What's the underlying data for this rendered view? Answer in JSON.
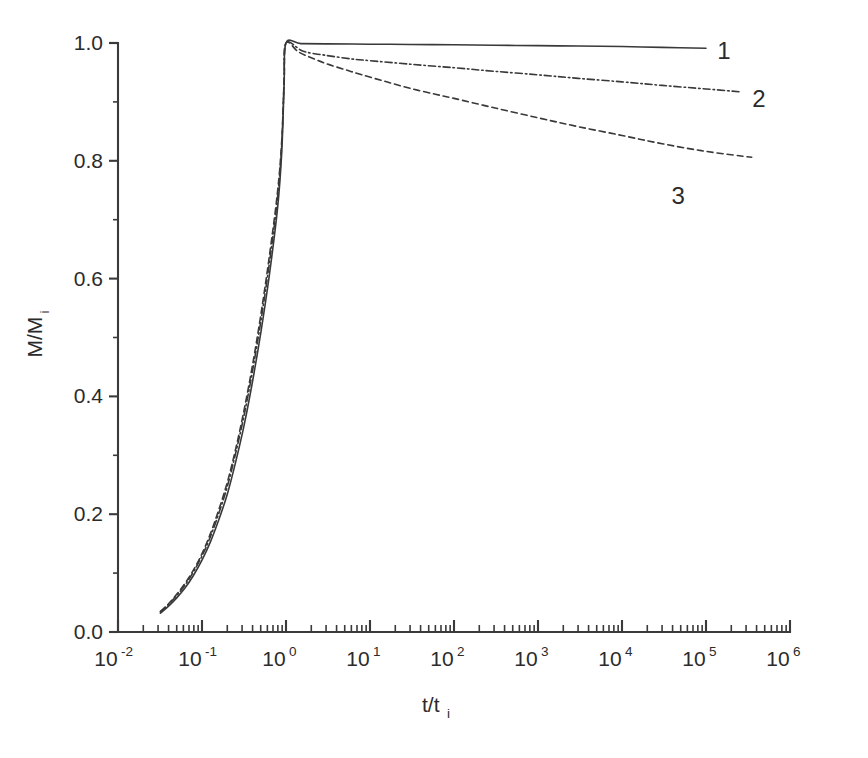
{
  "figure": {
    "background_color": "#ffffff",
    "line_color": "#39393b",
    "text_color": "#2b2b2b"
  },
  "chart_data": {
    "type": "line",
    "title": "",
    "subtitle": "",
    "xlabel": "t/t",
    "xlabel_sub": "i",
    "ylabel": "M/M",
    "ylabel_sub": "i",
    "xscale": "log",
    "yscale": "linear",
    "xlim": [
      0.01,
      1000000
    ],
    "ylim": [
      0.0,
      1.0
    ],
    "grid": false,
    "legend_position": "inline-right",
    "x_tick_labels": [
      "10-2",
      "10-1",
      "100",
      "101",
      "102",
      "103",
      "104",
      "105",
      "106"
    ],
    "x_tick_mantissa": [
      "10",
      "10",
      "10",
      "10",
      "10",
      "10",
      "10",
      "10",
      "10"
    ],
    "x_tick_exponents": [
      "-2",
      "-1",
      "0",
      "1",
      "2",
      "3",
      "4",
      "5",
      "6"
    ],
    "x_tick_values": [
      0.01,
      0.1,
      1,
      10,
      100,
      1000,
      10000,
      100000,
      1000000
    ],
    "y_tick_labels": [
      "0.0",
      "0.2",
      "0.4",
      "0.6",
      "0.8",
      "1.0"
    ],
    "y_tick_values": [
      0.0,
      0.2,
      0.4,
      0.6,
      0.8,
      1.0
    ],
    "y_minor_tick_values": [
      0.1,
      0.3,
      0.5,
      0.7,
      0.9
    ],
    "annotations": [
      {
        "name": "curve-label-1",
        "text": "1",
        "x": 100000,
        "y": 0.985
      },
      {
        "name": "curve-label-2",
        "text": "2",
        "x": 260000,
        "y": 0.925
      },
      {
        "name": "curve-label-3",
        "text": "3",
        "x": 90000,
        "y": 0.785
      }
    ],
    "series": [
      {
        "name": "1",
        "label": "1",
        "style": "solid",
        "points": [
          [
            0.032,
            0.032
          ],
          [
            0.04,
            0.044
          ],
          [
            0.05,
            0.058
          ],
          [
            0.063,
            0.075
          ],
          [
            0.079,
            0.096
          ],
          [
            0.1,
            0.122
          ],
          [
            0.126,
            0.153
          ],
          [
            0.158,
            0.19
          ],
          [
            0.2,
            0.234
          ],
          [
            0.251,
            0.288
          ],
          [
            0.316,
            0.35
          ],
          [
            0.398,
            0.424
          ],
          [
            0.501,
            0.508
          ],
          [
            0.631,
            0.604
          ],
          [
            0.794,
            0.72
          ],
          [
            0.89,
            0.815
          ],
          [
            0.95,
            0.93
          ],
          [
            1.0,
            1.0
          ],
          [
            1.5,
            0.999
          ],
          [
            3,
            0.9985
          ],
          [
            10,
            0.998
          ],
          [
            30,
            0.9975
          ],
          [
            100,
            0.997
          ],
          [
            300,
            0.9962
          ],
          [
            1000,
            0.9955
          ],
          [
            3000,
            0.9948
          ],
          [
            10000,
            0.994
          ],
          [
            30000,
            0.9925
          ],
          [
            100000,
            0.991
          ]
        ]
      },
      {
        "name": "2",
        "label": "2",
        "style": "dash-dot",
        "points": [
          [
            0.032,
            0.034
          ],
          [
            0.04,
            0.047
          ],
          [
            0.05,
            0.062
          ],
          [
            0.063,
            0.08
          ],
          [
            0.079,
            0.102
          ],
          [
            0.1,
            0.129
          ],
          [
            0.126,
            0.162
          ],
          [
            0.158,
            0.201
          ],
          [
            0.2,
            0.247
          ],
          [
            0.251,
            0.303
          ],
          [
            0.316,
            0.367
          ],
          [
            0.398,
            0.442
          ],
          [
            0.501,
            0.527
          ],
          [
            0.631,
            0.624
          ],
          [
            0.794,
            0.738
          ],
          [
            0.89,
            0.828
          ],
          [
            0.95,
            0.935
          ],
          [
            1.0,
            1.0
          ],
          [
            1.6,
            0.986
          ],
          [
            3,
            0.979
          ],
          [
            6,
            0.973
          ],
          [
            10,
            0.97
          ],
          [
            30,
            0.964
          ],
          [
            100,
            0.958
          ],
          [
            300,
            0.952
          ],
          [
            1000,
            0.946
          ],
          [
            3000,
            0.94
          ],
          [
            10000,
            0.934
          ],
          [
            30000,
            0.928
          ],
          [
            100000,
            0.922
          ],
          [
            260000,
            0.917
          ]
        ]
      },
      {
        "name": "3",
        "label": "3",
        "style": "dashed",
        "points": [
          [
            0.032,
            0.035
          ],
          [
            0.04,
            0.048
          ],
          [
            0.05,
            0.064
          ],
          [
            0.063,
            0.083
          ],
          [
            0.079,
            0.105
          ],
          [
            0.1,
            0.133
          ],
          [
            0.126,
            0.167
          ],
          [
            0.158,
            0.207
          ],
          [
            0.2,
            0.254
          ],
          [
            0.251,
            0.31
          ],
          [
            0.316,
            0.376
          ],
          [
            0.398,
            0.452
          ],
          [
            0.501,
            0.538
          ],
          [
            0.631,
            0.636
          ],
          [
            0.794,
            0.748
          ],
          [
            0.89,
            0.835
          ],
          [
            0.95,
            0.938
          ],
          [
            1.0,
            1.0
          ],
          [
            1.4,
            0.985
          ],
          [
            2,
            0.975
          ],
          [
            3,
            0.965
          ],
          [
            5,
            0.955
          ],
          [
            8,
            0.946
          ],
          [
            15,
            0.935
          ],
          [
            30,
            0.923
          ],
          [
            60,
            0.913
          ],
          [
            100,
            0.906
          ],
          [
            300,
            0.89
          ],
          [
            1000,
            0.873
          ],
          [
            3000,
            0.858
          ],
          [
            10000,
            0.843
          ],
          [
            30000,
            0.829
          ],
          [
            100000,
            0.816
          ],
          [
            350000,
            0.806
          ]
        ]
      }
    ]
  }
}
